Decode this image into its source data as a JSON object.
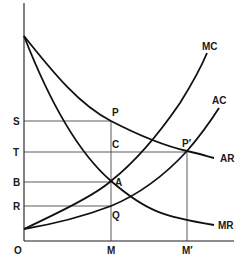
{
  "diagram": {
    "type": "economics-cost-revenue-curves",
    "axes": {
      "origin_label": "O",
      "x_ticks": [
        "M",
        "M′"
      ],
      "y_ticks": [
        "S",
        "T",
        "B",
        "R"
      ]
    },
    "curves": {
      "mc": "MC",
      "ac": "AC",
      "ar": "AR",
      "mr": "MR"
    },
    "points": {
      "p": "P",
      "c": "C",
      "a": "A",
      "q": "Q",
      "p_prime": "P′"
    }
  }
}
